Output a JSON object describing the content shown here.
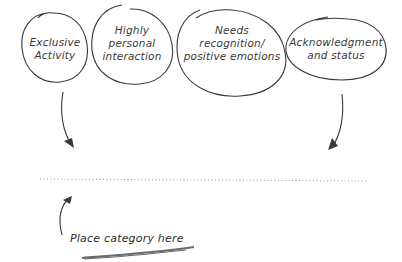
{
  "diagram": {
    "bubbles": [
      {
        "id": "exclusive-activity",
        "line1": "Exclusive",
        "line2": "Activity",
        "line3": ""
      },
      {
        "id": "personal-interaction",
        "line1": "Highly",
        "line2": "personal",
        "line3": "interaction"
      },
      {
        "id": "recognition",
        "line1": "Needs",
        "line2": "recognition/",
        "line3": "positive emotions"
      },
      {
        "id": "acknowledgment",
        "line1": "Acknowledgment",
        "line2": "and status",
        "line3": ""
      }
    ],
    "placeholder_line": "dotted",
    "instruction": "Place category here",
    "colors": {
      "ink": "#3a3a3a",
      "underline": "#6a6a6a",
      "dots": "#9a9a9a"
    }
  }
}
